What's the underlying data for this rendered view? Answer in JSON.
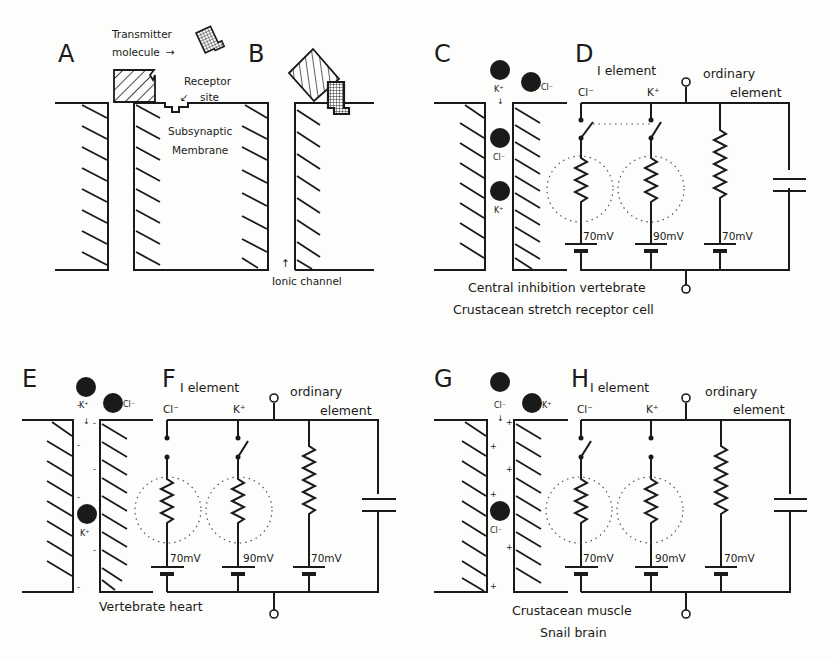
{
  "figure": {
    "panels": {
      "A": {
        "label": "A",
        "transmitter_label_line1": "Transmitter",
        "transmitter_label_line2": "molecule",
        "arrow": "→",
        "receptor_label_line1": "Receptor",
        "receptor_label_line2": "site",
        "membrane_label_line1": "Subsynaptic",
        "membrane_label_line2": "Membrane"
      },
      "B": {
        "label": "B",
        "channel_label": "Ionic channel"
      },
      "C": {
        "label": "C",
        "ions": [
          "K⁺",
          "Cl⁻",
          "Cl⁻",
          "K⁺"
        ]
      },
      "D": {
        "label": "D",
        "i_element": "I element",
        "ordinary_line1": "ordinary",
        "ordinary_line2": "element",
        "branch1_ion": "Cl⁻",
        "branch2_ion": "K⁺",
        "voltages": [
          "70mV",
          "90mV",
          "70mV"
        ],
        "caption_line1": "Central  inhibition  vertebrate",
        "caption_line2": "Crustacean stretch receptor cell"
      },
      "E": {
        "label": "E",
        "ions": [
          "K⁺",
          "Cl⁻",
          "K⁺"
        ],
        "charge": "-"
      },
      "F": {
        "label": "F",
        "i_element": "I element",
        "ordinary_line1": "ordinary",
        "ordinary_line2": "element",
        "branch1_ion": "Cl⁻",
        "branch2_ion": "K⁺",
        "voltages": [
          "70mV",
          "90mV",
          "70mV"
        ],
        "caption_line1": "Vertebrate heart"
      },
      "G": {
        "label": "G",
        "ions": [
          "Cl⁻",
          "K⁺",
          "Cl⁻"
        ],
        "charge": "+"
      },
      "H": {
        "label": "H",
        "i_element": "I element",
        "ordinary_line1": "ordinary",
        "ordinary_line2": "element",
        "branch1_ion": "Cl⁻",
        "branch2_ion": "K⁺",
        "voltages": [
          "70mV",
          "90mV",
          "70mV"
        ],
        "caption_line1": "Crustacean muscle",
        "caption_line2": "Snail brain"
      }
    },
    "colors": {
      "ink": "#1a1a1a",
      "paper": "#fdfdfb"
    }
  }
}
